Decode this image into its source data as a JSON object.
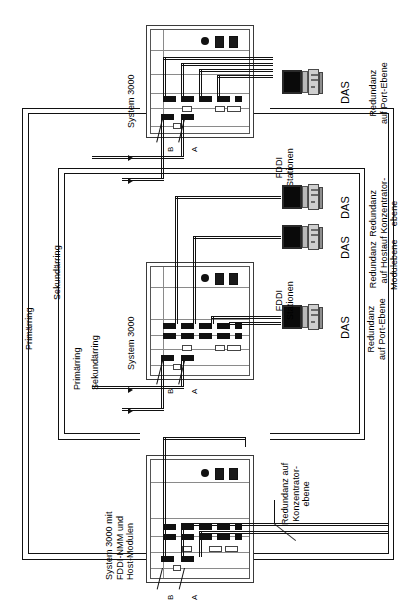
{
  "diagram": {
    "language": "de",
    "orientation": "rotated-90-ccw",
    "ink_color": "#111111",
    "paper_color": "#ffffff"
  },
  "rings": {
    "primary_label": "Primärring",
    "secondary_label": "Sekundärring",
    "outer_pair": {
      "primary": "Primärring",
      "secondary": "Sekundärring"
    },
    "inner_pair": {
      "primary": "Primärring",
      "secondary": "Sekundärring"
    }
  },
  "chassis": [
    {
      "id": "top",
      "title": "System 3000",
      "port_labels": {
        "a": "A",
        "b": "B"
      },
      "leds": [
        "round",
        "square",
        "square"
      ]
    },
    {
      "id": "middle",
      "title": "System 3000",
      "port_labels": {
        "a": "A",
        "b": "B"
      },
      "leds": [
        "round",
        "square",
        "square"
      ]
    },
    {
      "id": "bottom",
      "title": "System 3000 mit\nFDDI-NMM und\nHost-Modulen",
      "port_labels": {
        "a": "A",
        "b": "B"
      },
      "leds": [
        "round",
        "square",
        "square"
      ]
    }
  ],
  "stations": [
    {
      "id": "das-port-ebene",
      "type": "DAS",
      "type_label": "DAS",
      "caption": "Redundanz\nauf Port-Ebene",
      "group_label": "FDDI\nStationen",
      "icon": "workstation-icon"
    },
    {
      "id": "das-konzentrator-ebene",
      "type": "DAS",
      "type_label": "DAS",
      "caption": "Redundanz\nauf Konzentrator-\nebene",
      "icon": "workstation-icon"
    },
    {
      "id": "das-host-modulebene",
      "type": "DAS",
      "type_label": "DAS",
      "caption": "Redundanz\nauf Host-\nModulebene",
      "icon": "workstation-icon"
    },
    {
      "id": "das-port-ebene-2",
      "type": "DAS",
      "type_label": "DAS",
      "caption": "Redundanz\nauf Port-Ebene",
      "group_label": "FDDI\nStationen",
      "icon": "workstation-icon"
    }
  ],
  "annotations": [
    {
      "id": "konzentrator-redundanz",
      "text": "Redundanz auf\nKonzentrator-\nebene",
      "has_leader_line": true
    }
  ]
}
